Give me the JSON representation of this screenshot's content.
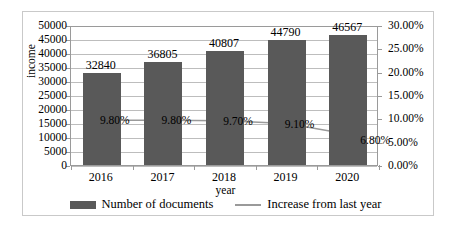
{
  "chart_data": {
    "type": "bar",
    "title": "",
    "subtitle": "",
    "xlabel": "year",
    "ylabel": "income",
    "y2label": "",
    "categories": [
      "2016",
      "2017",
      "2018",
      "2019",
      "2020"
    ],
    "ylim": [
      0,
      50000
    ],
    "y2lim": [
      0,
      0.3
    ],
    "y_ticks": [
      "0",
      "5000",
      "10000",
      "15000",
      "20000",
      "25000",
      "30000",
      "35000",
      "40000",
      "45000",
      "50000"
    ],
    "y_tick_values": [
      0,
      5000,
      10000,
      15000,
      20000,
      25000,
      30000,
      35000,
      40000,
      45000,
      50000
    ],
    "y2_ticks": [
      "0.00%",
      "5.00%",
      "10.00%",
      "15.00%",
      "20.00%",
      "25.00%",
      "30.00%"
    ],
    "y2_tick_values": [
      0,
      0.05,
      0.1,
      0.15,
      0.2,
      0.25,
      0.3
    ],
    "grid": true,
    "legend_position": "bottom",
    "series": [
      {
        "name": "Number of documents",
        "type": "bar",
        "axis": "left",
        "color": "#595959",
        "values": [
          32840,
          36805,
          40807,
          44790,
          46567
        ],
        "data_labels": [
          "32840",
          "36805",
          "40807",
          "44790",
          "46567"
        ]
      },
      {
        "name": "Increase from last year",
        "type": "line",
        "axis": "right",
        "color": "#9a9a9a",
        "values": [
          0.098,
          0.098,
          0.097,
          0.091,
          0.068
        ],
        "data_labels": [
          "9.80%",
          "9.80%",
          "9.70%",
          "9.10%",
          "6.80%"
        ]
      }
    ]
  },
  "legend": {
    "entries": [
      {
        "label": "Number of documents",
        "marker": "bar-swatch-icon"
      },
      {
        "label": "Increase from last year",
        "marker": "line-swatch-icon"
      }
    ]
  }
}
